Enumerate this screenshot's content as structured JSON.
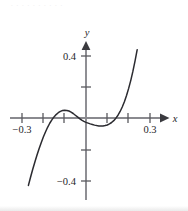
{
  "figure": {
    "background_color": "#ffffff",
    "top_text_fragment": "     .   .  .     .  .  .       . .  .  .",
    "axis_color": "#8a8a8f",
    "curve_color": "#2b2b30",
    "tick_color": "#5a5a5f",
    "text_color": "#26262a"
  },
  "chart_data": {
    "type": "line",
    "title": "",
    "subtitle": "",
    "xlabel": "x",
    "ylabel": "y",
    "grid": false,
    "legend": null,
    "xlim": [
      -0.36,
      0.39
    ],
    "ylim": [
      -0.52,
      0.55
    ],
    "x_ticks": [
      -0.3,
      -0.2,
      -0.1,
      0.1,
      0.2,
      0.3
    ],
    "x_tick_labels": [
      "−0.3",
      "",
      "",
      "",
      "",
      "0.3"
    ],
    "y_ticks": [
      0.4,
      0.2,
      -0.2,
      -0.4
    ],
    "y_tick_labels": [
      "0.4",
      "",
      "",
      "−0.4"
    ],
    "axis_arrows": [
      "x-positive",
      "y-positive"
    ],
    "series": [
      {
        "name": "curve",
        "description": "cubic-like curve with local maximum left of origin and local minimum right of origin",
        "x": [
          -0.27,
          -0.26,
          -0.25,
          -0.24,
          -0.23,
          -0.22,
          -0.21,
          -0.2,
          -0.19,
          -0.18,
          -0.17,
          -0.16,
          -0.15,
          -0.14,
          -0.13,
          -0.12,
          -0.11,
          -0.1,
          -0.09,
          -0.08,
          -0.07,
          -0.06,
          -0.05,
          -0.04,
          -0.03,
          -0.02,
          -0.01,
          0.0,
          0.01,
          0.02,
          0.03,
          0.04,
          0.05,
          0.06,
          0.07,
          0.08,
          0.09,
          0.1,
          0.11,
          0.12,
          0.13,
          0.14,
          0.15,
          0.16,
          0.17,
          0.18,
          0.19,
          0.2,
          0.21,
          0.22,
          0.23,
          0.24
        ],
        "y": [
          -0.435,
          -0.382,
          -0.332,
          -0.285,
          -0.24,
          -0.198,
          -0.159,
          -0.123,
          -0.09,
          -0.06,
          -0.034,
          -0.012,
          0.007,
          0.022,
          0.034,
          0.043,
          0.048,
          0.05,
          0.049,
          0.045,
          0.038,
          0.029,
          0.018,
          0.007,
          -0.004,
          -0.014,
          -0.022,
          -0.028,
          -0.033,
          -0.038,
          -0.042,
          -0.046,
          -0.049,
          -0.051,
          -0.052,
          -0.051,
          -0.049,
          -0.045,
          -0.038,
          -0.029,
          -0.017,
          -0.001,
          0.018,
          0.042,
          0.071,
          0.105,
          0.145,
          0.191,
          0.243,
          0.302,
          0.368,
          0.441
        ],
        "local_maximum": {
          "x": -0.1,
          "y": 0.05
        },
        "local_minimum": {
          "x": 0.07,
          "y": -0.052
        },
        "x_intercepts": [
          -0.157,
          0.0,
          0.14
        ]
      }
    ]
  }
}
